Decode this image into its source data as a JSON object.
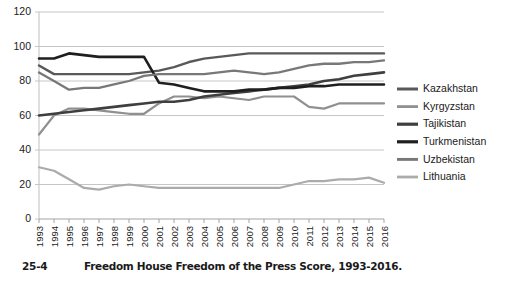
{
  "caption": {
    "number": "25-4",
    "text": "Freedom House Freedom of the Press Score, 1993-2016."
  },
  "chart_data": {
    "type": "line",
    "title": "",
    "subtitle": "",
    "xlabel": "",
    "ylabel": "",
    "grid": true,
    "legend_position": "right",
    "ylim": [
      0,
      120
    ],
    "yticks": [
      0,
      20,
      40,
      60,
      80,
      100,
      120
    ],
    "ytick_labels": [
      "0",
      "20",
      "40",
      "60",
      "80",
      "100",
      "120"
    ],
    "categories": [
      "1993",
      "1994",
      "1995",
      "1996",
      "1997",
      "1998",
      "1999",
      "2000",
      "2001",
      "2002",
      "2003",
      "2004",
      "2005",
      "2006",
      "2007",
      "2008",
      "2009",
      "2010",
      "2011",
      "2012",
      "2013",
      "2014",
      "2015",
      "2016"
    ],
    "series": [
      {
        "name": "Kazakhstan",
        "color": "#595959",
        "width": 2.4,
        "values": [
          89,
          84,
          84,
          84,
          84,
          84,
          84,
          85,
          86,
          88,
          91,
          93,
          94,
          95,
          96,
          96,
          96,
          96,
          96,
          96,
          96,
          96,
          96,
          96
        ]
      },
      {
        "name": "Kyrgyzstan",
        "color": "#909090",
        "width": 2.2,
        "values": [
          49,
          60,
          64,
          64,
          63,
          62,
          61,
          61,
          67,
          71,
          71,
          70,
          71,
          70,
          69,
          71,
          71,
          71,
          65,
          64,
          67,
          67,
          67,
          67
        ]
      },
      {
        "name": "Tajikistan",
        "color": "#3f3f3f",
        "width": 2.6,
        "values": [
          60,
          61,
          62,
          63,
          64,
          65,
          66,
          67,
          68,
          68,
          69,
          71,
          72,
          73,
          74,
          75,
          76,
          77,
          78,
          80,
          81,
          83,
          84,
          85
        ]
      },
      {
        "name": "Turkmenistan",
        "color": "#1f1f1f",
        "width": 2.6,
        "values": [
          93,
          93,
          96,
          95,
          94,
          94,
          94,
          94,
          79,
          78,
          76,
          74,
          74,
          74,
          75,
          75,
          76,
          76,
          77,
          77,
          78,
          78,
          78,
          78
        ]
      },
      {
        "name": "Uzbekistan",
        "color": "#787878",
        "width": 2.3,
        "values": [
          85,
          80,
          75,
          76,
          76,
          78,
          80,
          83,
          84,
          84,
          84,
          84,
          85,
          86,
          85,
          84,
          85,
          87,
          89,
          90,
          90,
          91,
          91,
          92
        ]
      },
      {
        "name": "Lithuania",
        "color": "#ababab",
        "width": 2.2,
        "values": [
          30,
          28,
          23,
          18,
          17,
          19,
          20,
          19,
          18,
          18,
          18,
          18,
          18,
          18,
          18,
          18,
          18,
          20,
          22,
          22,
          23,
          23,
          24,
          21
        ]
      }
    ]
  }
}
